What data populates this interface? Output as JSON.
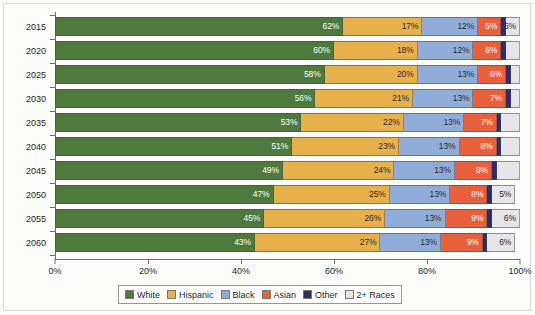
{
  "chart_data": {
    "type": "bar",
    "orientation": "horizontal",
    "stacked": true,
    "normalized_percent": true,
    "title": "",
    "subtitle": "",
    "xlabel": "",
    "ylabel": "",
    "xlim": [
      0,
      100
    ],
    "xticks": [
      "0%",
      "20%",
      "40%",
      "60%",
      "80%",
      "100%"
    ],
    "xtick_values": [
      0,
      20,
      40,
      60,
      80,
      100
    ],
    "grid": false,
    "legend_position": "bottom",
    "categories": [
      "2015",
      "2020",
      "2025",
      "2030",
      "2035",
      "2040",
      "2045",
      "2050",
      "2055",
      "2060"
    ],
    "series": [
      {
        "name": "White",
        "color": "#4e7a3d",
        "values": [
          62,
          60,
          58,
          56,
          53,
          51,
          49,
          47,
          45,
          43
        ]
      },
      {
        "name": "Hispanic",
        "color": "#e8b04b",
        "values": [
          17,
          18,
          20,
          21,
          22,
          23,
          24,
          25,
          26,
          27
        ]
      },
      {
        "name": "Black",
        "color": "#8fadd8",
        "values": [
          12,
          12,
          13,
          13,
          13,
          13,
          13,
          13,
          13,
          13
        ]
      },
      {
        "name": "Asian",
        "color": "#e8603c",
        "values": [
          5,
          6,
          6,
          7,
          7,
          8,
          8,
          8,
          9,
          9
        ]
      },
      {
        "name": "Other",
        "color": "#2e2d6b",
        "values": [
          1,
          1,
          1,
          1,
          1,
          1,
          1,
          1,
          1,
          1
        ]
      },
      {
        "name": "2+ Races",
        "color": "#e6e6ea",
        "values": [
          3,
          3,
          2,
          2,
          4,
          4,
          5,
          5,
          6,
          6
        ]
      }
    ],
    "data_labels": [
      {
        "year": "2015",
        "labels": {
          "White": "62%",
          "Hispanic": "17%",
          "Black": "12%",
          "Asian": "5%",
          "Other": "",
          "2+ Races": ""
        }
      },
      {
        "year": "2020",
        "labels": {
          "White": "60%",
          "Hispanic": "18%",
          "Black": "12%",
          "Asian": "6%",
          "Other": "",
          "2+ Races": ""
        }
      },
      {
        "year": "2025",
        "labels": {
          "White": "58%",
          "Hispanic": "20%",
          "Black": "13%",
          "Asian": "6%",
          "Other": "",
          "2+ Races": ""
        }
      },
      {
        "year": "2030",
        "labels": {
          "White": "56%",
          "Hispanic": "21%",
          "Black": "13%",
          "Asian": "7%",
          "Other": "",
          "2+ Races": ""
        }
      },
      {
        "year": "2035",
        "labels": {
          "White": "53%",
          "Hispanic": "22%",
          "Black": "13%",
          "Asian": "7%",
          "Other": "",
          "2+ Races": ""
        }
      },
      {
        "year": "2040",
        "labels": {
          "White": "51%",
          "Hispanic": "23%",
          "Black": "13%",
          "Asian": "8%",
          "Other": "",
          "2+ Races": ""
        }
      },
      {
        "year": "2045",
        "labels": {
          "White": "49%",
          "Hispanic": "24%",
          "Black": "13%",
          "Asian": "8%",
          "Other": "",
          "2+ Races": ""
        }
      },
      {
        "year": "2050",
        "labels": {
          "White": "47%",
          "Hispanic": "25%",
          "Black": "13%",
          "Asian": "8%",
          "Other": "",
          "2+ Races": "5%"
        }
      },
      {
        "year": "2055",
        "labels": {
          "White": "45%",
          "Hispanic": "26%",
          "Black": "13%",
          "Asian": "9%",
          "Other": "",
          "2+ Races": "6%"
        }
      },
      {
        "year": "2060",
        "labels": {
          "White": "43%",
          "Hispanic": "27%",
          "Black": "13%",
          "Asian": "9%",
          "Other": "",
          "2+ Races": "6%"
        }
      }
    ],
    "first_row_extra_label": {
      "year": "2015",
      "series": "2+ Races",
      "text": "5%"
    },
    "legend": [
      {
        "label": "White",
        "color": "#4e7a3d"
      },
      {
        "label": "Hispanic",
        "color": "#e8b04b"
      },
      {
        "label": "Black",
        "color": "#8fadd8"
      },
      {
        "label": "Asian",
        "color": "#e8603c"
      },
      {
        "label": "Other",
        "color": "#2e2d6b"
      },
      {
        "label": "2+ Races",
        "color": "#e6e6ea"
      }
    ]
  }
}
